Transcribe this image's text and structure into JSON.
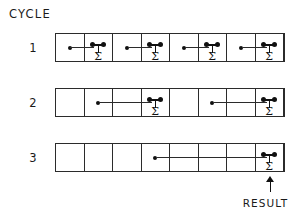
{
  "diagram": {
    "title": "CYCLE",
    "heading_label": "CYCLE",
    "result_label": "RESULT",
    "sigma_glyph": "Σ",
    "colors": {
      "ink": "#111111",
      "grid": "#2b2b2b",
      "background": "#ffffff"
    },
    "array_size": 8,
    "rows": [
      {
        "label": "1",
        "cycle": 1,
        "cells": [
          {
            "index": 0,
            "role": "source"
          },
          {
            "index": 1,
            "role": "target",
            "sigma": "Σ"
          },
          {
            "index": 2,
            "role": "source"
          },
          {
            "index": 3,
            "role": "target",
            "sigma": "Σ"
          },
          {
            "index": 4,
            "role": "source"
          },
          {
            "index": 5,
            "role": "target",
            "sigma": "Σ"
          },
          {
            "index": 6,
            "role": "source"
          },
          {
            "index": 7,
            "role": "target",
            "sigma": "Σ"
          }
        ],
        "links": [
          {
            "from": 0,
            "to": 1
          },
          {
            "from": 2,
            "to": 3
          },
          {
            "from": 4,
            "to": 5
          },
          {
            "from": 6,
            "to": 7
          }
        ]
      },
      {
        "label": "2",
        "cycle": 2,
        "cells": [
          {
            "index": 0,
            "role": "empty"
          },
          {
            "index": 1,
            "role": "source"
          },
          {
            "index": 2,
            "role": "empty"
          },
          {
            "index": 3,
            "role": "target",
            "sigma": "Σ"
          },
          {
            "index": 4,
            "role": "empty"
          },
          {
            "index": 5,
            "role": "source"
          },
          {
            "index": 6,
            "role": "empty"
          },
          {
            "index": 7,
            "role": "target",
            "sigma": "Σ"
          }
        ],
        "links": [
          {
            "from": 1,
            "to": 3
          },
          {
            "from": 5,
            "to": 7
          }
        ]
      },
      {
        "label": "3",
        "cycle": 3,
        "cells": [
          {
            "index": 0,
            "role": "empty"
          },
          {
            "index": 1,
            "role": "empty"
          },
          {
            "index": 2,
            "role": "empty"
          },
          {
            "index": 3,
            "role": "source"
          },
          {
            "index": 4,
            "role": "empty"
          },
          {
            "index": 5,
            "role": "empty"
          },
          {
            "index": 6,
            "role": "empty"
          },
          {
            "index": 7,
            "role": "target",
            "sigma": "Σ"
          }
        ],
        "links": [
          {
            "from": 3,
            "to": 7
          }
        ]
      }
    ],
    "result_pointer": {
      "points_to_row": 3,
      "points_to_cell": 7,
      "direction": "up"
    }
  }
}
